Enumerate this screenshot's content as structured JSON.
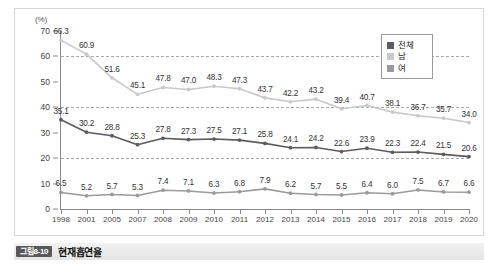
{
  "caption": {
    "badge": "그림8-10",
    "title": "현재흡연율"
  },
  "legend": {
    "position": "top-right",
    "items": [
      {
        "label": "전체",
        "color": "#5c5c5c"
      },
      {
        "label": "남",
        "color": "#c9c9c9"
      },
      {
        "label": "여",
        "color": "#9b9b9b"
      }
    ]
  },
  "chart_data": {
    "type": "line",
    "title": "현재흡연율",
    "xlabel": "",
    "ylabel": "(%)",
    "unit": "(%)",
    "ylim": [
      0,
      70
    ],
    "yticks": [
      0,
      10,
      20,
      30,
      40,
      50,
      60,
      70
    ],
    "gridlines": [
      20,
      40,
      60
    ],
    "grid": true,
    "x": [
      "1998",
      "2001",
      "2005",
      "2007",
      "2008",
      "2009",
      "2010",
      "2011",
      "2012",
      "2013",
      "2014",
      "2015",
      "2016",
      "2017",
      "2018",
      "2019",
      "2020"
    ],
    "categories": [
      "1998",
      "2001",
      "2005",
      "2007",
      "2008",
      "2009",
      "2010",
      "2011",
      "2012",
      "2013",
      "2014",
      "2015",
      "2016",
      "2017",
      "2018",
      "2019",
      "2020"
    ],
    "series": [
      {
        "name": "남",
        "color": "#c9c9c9",
        "label_position": "above",
        "values": [
          66.3,
          60.9,
          51.6,
          45.1,
          47.8,
          47.0,
          48.3,
          47.3,
          43.7,
          42.2,
          43.2,
          39.4,
          40.7,
          38.1,
          36.7,
          35.7,
          34.0
        ]
      },
      {
        "name": "전체",
        "color": "#5c5c5c",
        "label_position": "above",
        "values": [
          35.1,
          30.2,
          28.8,
          25.3,
          27.8,
          27.3,
          27.5,
          27.1,
          25.8,
          24.1,
          24.2,
          22.6,
          23.9,
          22.3,
          22.4,
          21.5,
          20.6
        ]
      },
      {
        "name": "여",
        "color": "#9b9b9b",
        "label_position": "above",
        "values": [
          6.5,
          5.2,
          5.7,
          5.3,
          7.4,
          7.1,
          6.3,
          6.8,
          7.9,
          6.2,
          5.7,
          5.5,
          6.4,
          6.0,
          7.5,
          6.7,
          6.6
        ]
      }
    ]
  }
}
